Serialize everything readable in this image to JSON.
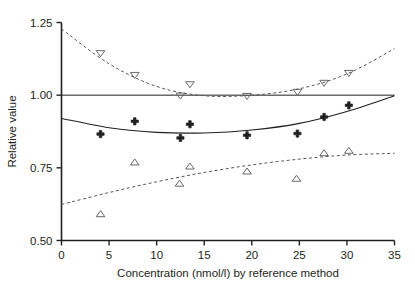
{
  "chart_data": {
    "type": "scatter",
    "title": "",
    "subtitle": "",
    "xlabel": "Concentration (nmol/l) by reference method",
    "ylabel": "Relative value",
    "xlim": [
      0,
      35
    ],
    "ylim": [
      0.5,
      1.25
    ],
    "xticks": [
      0,
      5,
      10,
      15,
      20,
      25,
      30,
      35
    ],
    "xticklabels": [
      "0",
      "5",
      "10",
      "15",
      "20",
      "25",
      "30",
      "35"
    ],
    "yticks": [
      0.5,
      0.75,
      1.0,
      1.25
    ],
    "yticklabels": [
      "0.50",
      "0.75",
      "1.00",
      "1.25"
    ],
    "grid": false,
    "legend": "none",
    "reference_line": {
      "y": 1.0,
      "style": "solid",
      "color": "#231f20"
    },
    "series": [
      {
        "name": "Upper limit of agreement",
        "marker": "triangle-down-open",
        "color": "#231f20",
        "line_style": "dashed",
        "points": [
          {
            "x": 4.1,
            "y": 1.145
          },
          {
            "x": 7.7,
            "y": 1.07
          },
          {
            "x": 12.5,
            "y": 0.999
          },
          {
            "x": 13.5,
            "y": 1.038
          },
          {
            "x": 19.5,
            "y": 0.998
          },
          {
            "x": 24.8,
            "y": 1.012
          },
          {
            "x": 27.6,
            "y": 1.043
          },
          {
            "x": 30.2,
            "y": 1.077
          }
        ],
        "fit_curve": {
          "type": "quadratic",
          "y_at": [
            [
              0,
              1.228
            ],
            [
              5,
              1.108
            ],
            [
              10,
              1.03
            ],
            [
              15,
              0.998
            ],
            [
              20,
              1.0
            ],
            [
              25,
              1.022
            ],
            [
              30,
              1.073
            ],
            [
              35,
              1.16
            ]
          ]
        }
      },
      {
        "name": "Mean relative value",
        "marker": "plus-filled",
        "color": "#231f20",
        "line_style": "solid",
        "points": [
          {
            "x": 4.1,
            "y": 0.866
          },
          {
            "x": 7.7,
            "y": 0.91
          },
          {
            "x": 12.5,
            "y": 0.853
          },
          {
            "x": 13.5,
            "y": 0.9
          },
          {
            "x": 19.5,
            "y": 0.862
          },
          {
            "x": 24.8,
            "y": 0.868
          },
          {
            "x": 27.6,
            "y": 0.925
          },
          {
            "x": 30.2,
            "y": 0.965
          }
        ],
        "fit_curve": {
          "type": "quadratic",
          "y_at": [
            [
              0,
              0.92
            ],
            [
              5,
              0.888
            ],
            [
              10,
              0.872
            ],
            [
              15,
              0.87
            ],
            [
              20,
              0.88
            ],
            [
              25,
              0.903
            ],
            [
              30,
              0.944
            ],
            [
              35,
              0.998
            ]
          ]
        }
      },
      {
        "name": "Lower limit of agreement",
        "marker": "triangle-up-open",
        "color": "#231f20",
        "line_style": "dashed",
        "points": [
          {
            "x": 4.1,
            "y": 0.59
          },
          {
            "x": 7.7,
            "y": 0.768
          },
          {
            "x": 12.4,
            "y": 0.695
          },
          {
            "x": 13.5,
            "y": 0.754
          },
          {
            "x": 19.5,
            "y": 0.737
          },
          {
            "x": 24.7,
            "y": 0.712
          },
          {
            "x": 27.6,
            "y": 0.8
          },
          {
            "x": 30.2,
            "y": 0.808
          }
        ],
        "fit_curve": {
          "type": "quadratic",
          "y_at": [
            [
              0,
              0.624
            ],
            [
              5,
              0.665
            ],
            [
              10,
              0.702
            ],
            [
              15,
              0.734
            ],
            [
              20,
              0.76
            ],
            [
              25,
              0.78
            ],
            [
              30,
              0.794
            ],
            [
              35,
              0.8
            ]
          ]
        }
      }
    ]
  }
}
